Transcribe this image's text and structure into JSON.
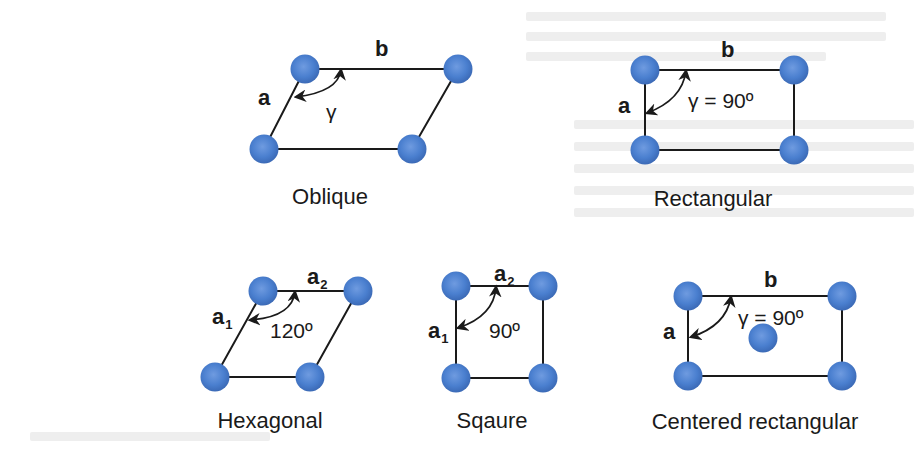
{
  "figure": {
    "atom_color": "#4a7fcf",
    "line_color": "#1a1a1a",
    "lattices": [
      {
        "id": "oblique",
        "caption": "Oblique",
        "vector_a": "a",
        "vector_b": "b",
        "angle_label": "γ"
      },
      {
        "id": "rectangular",
        "caption": "Rectangular",
        "vector_a": "a",
        "vector_b": "b",
        "angle_label": "γ = 90º"
      },
      {
        "id": "hexagonal",
        "caption": "Hexagonal",
        "vector_a": "a",
        "vector_a_sub": "1",
        "vector_b": "a",
        "vector_b_sub": "2",
        "angle_label": "120º"
      },
      {
        "id": "square",
        "caption": "Sqaure",
        "vector_a": "a",
        "vector_a_sub": "1",
        "vector_b": "a",
        "vector_b_sub": "2",
        "angle_label": "90º"
      },
      {
        "id": "centered-rectangular",
        "caption": "Centered rectangular",
        "vector_a": "a",
        "vector_b": "b",
        "angle_label": "γ = 90º"
      }
    ]
  }
}
